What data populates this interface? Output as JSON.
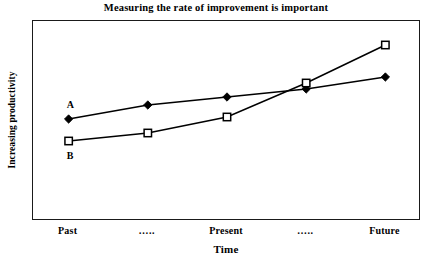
{
  "chart_data": {
    "type": "line",
    "title": "Measuring the rate of improvement is important",
    "xlabel": "Time",
    "ylabel": "Increasing productivity",
    "categories": [
      "Past",
      "…..",
      "Present",
      "…..",
      "Future"
    ],
    "x": [
      0,
      1,
      2,
      3,
      4
    ],
    "xlim": [
      -0.45,
      4.45
    ],
    "ylim": [
      0,
      100
    ],
    "grid": false,
    "legend": "inline-labels",
    "series": [
      {
        "name": "A",
        "label": "A",
        "marker": "filled-diamond",
        "color": "#000000",
        "values": [
          51,
          58,
          62,
          66,
          72
        ]
      },
      {
        "name": "B",
        "label": "B",
        "marker": "open-square",
        "color": "#000000",
        "values": [
          40,
          44,
          52,
          69,
          88
        ]
      }
    ],
    "annotations": [
      {
        "text": "A",
        "series": "A",
        "x": 0,
        "position": "above-left"
      },
      {
        "text": "B",
        "series": "B",
        "x": 0,
        "position": "below-left"
      }
    ]
  },
  "axes": {
    "y_tick_labels": [],
    "x_tick_labels": [
      "Past",
      "…..",
      "Present",
      "…..",
      "Future"
    ],
    "frame": "box"
  },
  "colors": {
    "line": "#000000",
    "frame": "#1a1a1a",
    "background": "#ffffff",
    "text": "#000000"
  }
}
